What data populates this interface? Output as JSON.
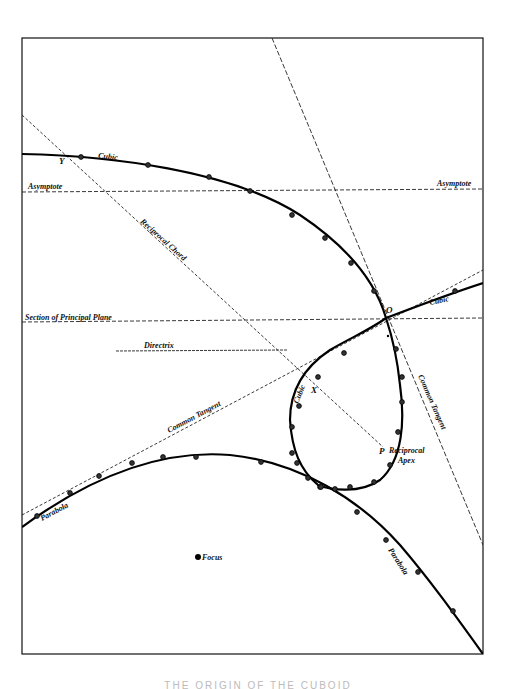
{
  "figure": {
    "frame": {
      "x1": 22,
      "y1": 38,
      "x2": 483,
      "y2": 654,
      "color": "#111111"
    },
    "caption": "THE ORIGIN OF THE CUBOID"
  },
  "curves": {
    "cubic_upper": {
      "label": "Cubic",
      "path": "M22,154 C110,156 230,170 300,215 C345,245 375,280 386,318 C395,345 398,365 400,385 C405,420 403,460 380,480 C360,494 330,490 318,485 C300,470 292,450 290,420 C290,395 300,370 330,350 C350,338 370,330 386,318",
      "points": [
        [
          81,
          157
        ],
        [
          148,
          165
        ],
        [
          209,
          177
        ],
        [
          250,
          191
        ],
        [
          292,
          215
        ],
        [
          325,
          238
        ],
        [
          351,
          263
        ],
        [
          374,
          291
        ]
      ]
    },
    "cubic_right": {
      "label": "Cubic",
      "path": "M386,318 C420,305 455,292 483,283",
      "points": [
        [
          455,
          291
        ]
      ]
    },
    "cubic_loop_points": [
      [
        396,
        349
      ],
      [
        402,
        377
      ],
      [
        402,
        402
      ],
      [
        398,
        432
      ],
      [
        390,
        465
      ],
      [
        374,
        482
      ],
      [
        350,
        487
      ],
      [
        335,
        489
      ],
      [
        320,
        487
      ],
      [
        308,
        478
      ],
      [
        297,
        463
      ],
      [
        292,
        453
      ],
      [
        292,
        427
      ],
      [
        299,
        406
      ],
      [
        318,
        377
      ],
      [
        344,
        353
      ]
    ],
    "parabola": {
      "label": "Parabola",
      "path": "M22,527 C100,470 170,450 230,455 C300,462 360,500 400,545 C430,580 455,615 483,654",
      "points": [
        [
          37,
          516
        ],
        [
          70,
          493
        ],
        [
          99,
          476
        ],
        [
          132,
          463
        ],
        [
          163,
          457
        ],
        [
          196,
          457
        ],
        [
          261,
          462
        ],
        [
          321,
          487
        ],
        [
          357,
          512
        ],
        [
          386,
          540
        ],
        [
          418,
          572
        ],
        [
          453,
          611
        ]
      ]
    }
  },
  "lines": [
    {
      "name": "asymptote-line",
      "label": "Asymptote",
      "x1": 22,
      "y1": 192,
      "x2": 483,
      "y2": 189,
      "dash": "4,2"
    },
    {
      "name": "principal-plane-line",
      "label": "Section of Principal Plane",
      "x1": 22,
      "y1": 322,
      "x2": 483,
      "y2": 318,
      "dash": "4,2"
    },
    {
      "name": "directrix-line",
      "label": "Directrix",
      "x1": 116,
      "y1": 351,
      "x2": 287,
      "y2": 350,
      "dash": "3,1"
    },
    {
      "name": "reciprocal-chord-line",
      "label": "Reciprocal Chord",
      "x1": 22,
      "y1": 115,
      "x2": 383,
      "y2": 447,
      "dash": "3,2"
    },
    {
      "name": "common-tangent-left-line",
      "label": "Common Tangent",
      "x1": 22,
      "y1": 515,
      "x2": 483,
      "y2": 270,
      "dash": "3,2"
    },
    {
      "name": "common-tangent-right-line",
      "label": "Common Tangent",
      "x1": 272,
      "y1": 38,
      "x2": 483,
      "y2": 545,
      "dash": "5,2"
    }
  ],
  "labels": [
    {
      "name": "label-cubic-top",
      "text": "Cubic",
      "x": 98,
      "y": 158,
      "rotate": 6
    },
    {
      "name": "label-y",
      "text": "Y",
      "x": 59,
      "y": 164,
      "rotate": 0
    },
    {
      "name": "label-asymptote-left",
      "text": "Asymptote",
      "x": 28,
      "y": 189,
      "rotate": 0
    },
    {
      "name": "label-asymptote-right",
      "text": "Asymptote",
      "x": 437,
      "y": 186,
      "rotate": 0
    },
    {
      "name": "label-reciprocal-chord",
      "text": "Reciprocal   Chord",
      "x": 140,
      "y": 222,
      "rotate": 42
    },
    {
      "name": "label-principal-plane",
      "text": "Section of Principal Plane",
      "x": 25,
      "y": 320,
      "rotate": 0
    },
    {
      "name": "label-directrix",
      "text": "Directrix",
      "x": 144,
      "y": 348,
      "rotate": 0
    },
    {
      "name": "label-o",
      "text": "O",
      "x": 386,
      "y": 313,
      "rotate": 0
    },
    {
      "name": "label-cubic-right",
      "text": "Cubic",
      "x": 430,
      "y": 305,
      "rotate": -12
    },
    {
      "name": "label-cubic-loop",
      "text": "Cubic",
      "x": 298,
      "y": 404,
      "rotate": -68
    },
    {
      "name": "label-x",
      "text": "X",
      "x": 311,
      "y": 393,
      "rotate": 0
    },
    {
      "name": "label-common-tangent-left",
      "text": "Common  Tangent",
      "x": 169,
      "y": 433,
      "rotate": -28
    },
    {
      "name": "label-common-tangent-right",
      "text": "Common  Tangent",
      "x": 418,
      "y": 376,
      "rotate": 66
    },
    {
      "name": "label-p",
      "text": "P",
      "x": 379,
      "y": 454,
      "rotate": 0
    },
    {
      "name": "label-reciprocal",
      "text": "Reciprocal",
      "x": 389,
      "y": 453,
      "rotate": 0
    },
    {
      "name": "label-apex",
      "text": "Apex",
      "x": 398,
      "y": 463,
      "rotate": 0
    },
    {
      "name": "label-parabola-left",
      "text": "Parabola",
      "x": 42,
      "y": 521,
      "rotate": -28
    },
    {
      "name": "label-focus",
      "text": "Focus",
      "x": 202,
      "y": 560,
      "rotate": 0
    },
    {
      "name": "label-parabola-right",
      "text": "Parabola",
      "x": 388,
      "y": 550,
      "rotate": 57
    }
  ],
  "markers": {
    "focus": {
      "x": 198,
      "y": 557,
      "r": 3
    },
    "small_dot": {
      "x": 388,
      "y": 336,
      "r": 1.2
    }
  }
}
